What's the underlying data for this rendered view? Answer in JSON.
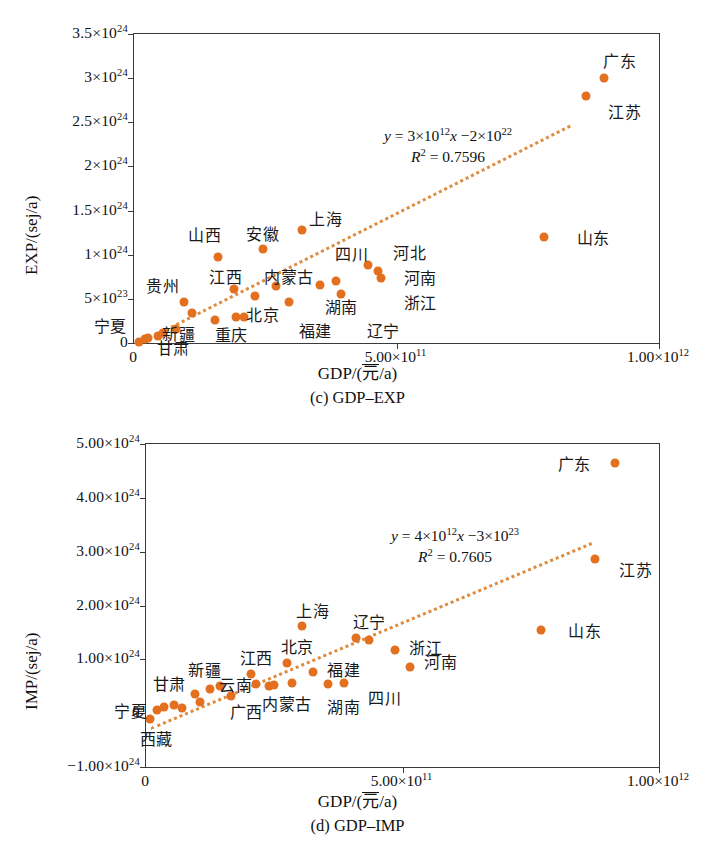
{
  "figure": {
    "point_color": "#e2701e",
    "trend_color": "#e08a3c",
    "axis_color": "#3a3a3a"
  },
  "chart_data": [
    {
      "type": "scatter",
      "id": "c",
      "caption": "(c) GDP–EXP",
      "title": "",
      "xlabel_prefix": "GDP/(",
      "xlabel_unit": "元",
      "xlabel_suffix": "/a)",
      "ylabel": "EXP/(sej/a)",
      "xlim": [
        0,
        1000000000000.0
      ],
      "ylim": [
        0,
        3.5e+24
      ],
      "grid": false,
      "xticks": [
        {
          "value": 0,
          "label": "0"
        },
        {
          "value": 500000000000.0,
          "label": "5.00×10",
          "exp": "11"
        },
        {
          "value": 1000000000000.0,
          "label": "1.00×10",
          "exp": "12"
        }
      ],
      "yticks": [
        {
          "value": 0,
          "label": "0",
          "exp": ""
        },
        {
          "value": 5e+23,
          "label": "5×10",
          "exp": "23"
        },
        {
          "value": 1e+24,
          "label": "1×10",
          "exp": "24"
        },
        {
          "value": 1.5e+24,
          "label": "1.5×10",
          "exp": "24"
        },
        {
          "value": 2e+24,
          "label": "2×10",
          "exp": "24"
        },
        {
          "value": 2.5e+24,
          "label": "2.5×10",
          "exp": "24"
        },
        {
          "value": 3e+24,
          "label": "3×10",
          "exp": "24"
        },
        {
          "value": 3.5e+24,
          "label": "3.5×10",
          "exp": "24"
        }
      ],
      "equation": "y = 3×10¹²x −2×10²²",
      "equation_parts": {
        "lead": "y",
        "eq": " = 3×10",
        "e1": "12",
        "xvar": "x",
        "tail": " −2×10",
        "e2": "22"
      },
      "r2_label": "R",
      "r2_sup": "2",
      "r2_value": " = 0.7596",
      "trendline": {
        "slope": 3000000000000.0,
        "intercept": -2e+22,
        "x_start": 40000000000.0,
        "x_end": 830000000000.0
      },
      "points": [
        {
          "name": "宁夏",
          "x": 10000000000.0,
          "y": 1e+22,
          "lx": -0.045,
          "ly": 2e+23
        },
        {
          "name": "西藏",
          "x": 20000000000.0,
          "y": 4e+22,
          "lx": null,
          "ly": null
        },
        {
          "name": "青海",
          "x": 26000000000.0,
          "y": 6e+22,
          "lx": null,
          "ly": null
        },
        {
          "name": "甘肃",
          "x": 45000000000.0,
          "y": 8e+22,
          "lx": 0.075,
          "ly": -4e+22
        },
        {
          "name": "海南",
          "x": 55000000000.0,
          "y": 1.1e+23,
          "lx": null,
          "ly": null
        },
        {
          "name": "新疆",
          "x": 80000000000.0,
          "y": 1.6e+23,
          "lx": 0.085,
          "ly": 1.1e+23
        },
        {
          "name": "贵州",
          "x": 95000000000.0,
          "y": 4.6e+23,
          "lx": 0.055,
          "ly": 6.6e+23
        },
        {
          "name": "吉林",
          "x": 110000000000.0,
          "y": 3.4e+23,
          "lx": null,
          "ly": null
        },
        {
          "name": "山西",
          "x": 160000000000.0,
          "y": 9.7e+23,
          "lx": 0.135,
          "ly": 1.23e+24
        },
        {
          "name": "重庆",
          "x": 155000000000.0,
          "y": 2.6e+23,
          "lx": 0.185,
          "ly": 1e+23
        },
        {
          "name": "江西",
          "x": 190000000000.0,
          "y": 6.1e+23,
          "lx": 0.175,
          "ly": 7.6e+23
        },
        {
          "name": "广西",
          "x": 195000000000.0,
          "y": 2.9e+23,
          "lx": null,
          "ly": null
        },
        {
          "name": "北京",
          "x": 210000000000.0,
          "y": 3e+23,
          "lx": 0.245,
          "ly": 3.3e+23
        },
        {
          "name": "安徽",
          "x": 245000000000.0,
          "y": 1.06e+24,
          "lx": 0.245,
          "ly": 1.25e+24
        },
        {
          "name": "云南",
          "x": 230000000000.0,
          "y": 5.3e+23,
          "lx": null,
          "ly": null
        },
        {
          "name": "内蒙古",
          "x": 270000000000.0,
          "y": 6.4e+23,
          "lx": 0.295,
          "ly": 7.6e+23
        },
        {
          "name": "福建",
          "x": 295000000000.0,
          "y": 4.6e+23,
          "lx": 0.345,
          "ly": 1.5e+23
        },
        {
          "name": "上海",
          "x": 320000000000.0,
          "y": 1.28e+24,
          "lx": 0.365,
          "ly": 1.42e+24
        },
        {
          "name": "湖南",
          "x": 355000000000.0,
          "y": 6.6e+23,
          "lx": 0.395,
          "ly": 4.2e+23
        },
        {
          "name": "四川",
          "x": 385000000000.0,
          "y": 7e+23,
          "lx": 0.415,
          "ly": 1.02e+24
        },
        {
          "name": "辽宁",
          "x": 395000000000.0,
          "y": 5.5e+23,
          "lx": 0.475,
          "ly": 1.5e+23
        },
        {
          "name": "河北",
          "x": 445000000000.0,
          "y": 8.8e+23,
          "lx": 0.525,
          "ly": 1.03e+24
        },
        {
          "name": "河南",
          "x": 465000000000.0,
          "y": 8.2e+23,
          "lx": 0.545,
          "ly": 7.5e+23
        },
        {
          "name": "浙江",
          "x": 470000000000.0,
          "y": 7.4e+23,
          "lx": 0.545,
          "ly": 4.6e+23
        },
        {
          "name": "山东",
          "x": 780000000000.0,
          "y": 1.2e+24,
          "lx": 0.875,
          "ly": 1.2e+24
        },
        {
          "name": "江苏",
          "x": 860000000000.0,
          "y": 2.8e+24,
          "lx": 0.935,
          "ly": 2.63e+24
        },
        {
          "name": "广东",
          "x": 895000000000.0,
          "y": 3e+24,
          "lx": 0.925,
          "ly": 3.2e+24
        }
      ]
    },
    {
      "type": "scatter",
      "id": "d",
      "caption": "(d) GDP–IMP",
      "title": "",
      "xlabel_prefix": "GDP/(",
      "xlabel_unit": "元",
      "xlabel_suffix": "/a)",
      "ylabel": "IMP/(sej/a)",
      "xlim": [
        0,
        1000000000000.0
      ],
      "ylim": [
        -1e+24,
        5e+24
      ],
      "grid": false,
      "xticks": [
        {
          "value": 0,
          "label": "0"
        },
        {
          "value": 500000000000.0,
          "label": "5.00×10",
          "exp": "11"
        },
        {
          "value": 1000000000000.0,
          "label": "1.00×10",
          "exp": "12"
        }
      ],
      "yticks": [
        {
          "value": -1e+24,
          "label": "−1.00×10",
          "exp": "24"
        },
        {
          "value": 0,
          "label": "0",
          "exp": ""
        },
        {
          "value": 1e+24,
          "label": "1.00×10",
          "exp": "24"
        },
        {
          "value": 2e+24,
          "label": "2.00×10",
          "exp": "24"
        },
        {
          "value": 3e+24,
          "label": "3.00×10",
          "exp": "24"
        },
        {
          "value": 4e+24,
          "label": "4.00×10",
          "exp": "24"
        },
        {
          "value": 5e+24,
          "label": "5.00×10",
          "exp": "24"
        }
      ],
      "equation": "y = 4×10¹²x −3×10²³",
      "equation_parts": {
        "lead": "y",
        "eq": " = 4×10",
        "e1": "12",
        "xvar": "x",
        "tail": " −3×10",
        "e2": "23"
      },
      "r2_label": "R",
      "r2_sup": "2",
      "r2_value": " = 0.7605",
      "trendline": {
        "slope": 4000000000000.0,
        "intercept": -3e+23,
        "x_start": 10000000000.0,
        "x_end": 870000000000.0
      },
      "points": [
        {
          "name": "西藏",
          "x": 8000000000.0,
          "y": -1e+23,
          "lx": 0.02,
          "ly": -4.6e+23
        },
        {
          "name": "宁夏",
          "x": 22000000000.0,
          "y": 5e+22,
          "lx": -0.03,
          "ly": 5e+22
        },
        {
          "name": "青海",
          "x": 35000000000.0,
          "y": 1.2e+23,
          "lx": null,
          "ly": null
        },
        {
          "name": "甘肃",
          "x": 55000000000.0,
          "y": 1.6e+23,
          "lx": 0.045,
          "ly": 5.6e+23
        },
        {
          "name": "海南",
          "x": 70000000000.0,
          "y": 1e+23,
          "lx": null,
          "ly": null
        },
        {
          "name": "新疆",
          "x": 95000000000.0,
          "y": 3.6e+23,
          "lx": 0.115,
          "ly": 8.2e+23
        },
        {
          "name": "贵州",
          "x": 105000000000.0,
          "y": 2e+23,
          "lx": null,
          "ly": null
        },
        {
          "name": "吉林",
          "x": 125000000000.0,
          "y": 4.4e+23,
          "lx": null,
          "ly": null
        },
        {
          "name": "云南",
          "x": 145000000000.0,
          "y": 5e+23,
          "lx": 0.175,
          "ly": 5.4e+23
        },
        {
          "name": "广西",
          "x": 165000000000.0,
          "y": 3.2e+23,
          "lx": 0.195,
          "ly": 4e+22
        },
        {
          "name": "江西",
          "x": 205000000000.0,
          "y": 7.2e+23,
          "lx": 0.215,
          "ly": 1.04e+24
        },
        {
          "name": "重庆",
          "x": 215000000000.0,
          "y": 5.4e+23,
          "lx": null,
          "ly": null
        },
        {
          "name": "内蒙古",
          "x": 240000000000.0,
          "y": 5e+23,
          "lx": 0.275,
          "ly": 1.8e+23
        },
        {
          "name": "山西",
          "x": 250000000000.0,
          "y": 5.2e+23,
          "lx": null,
          "ly": null
        },
        {
          "name": "北京",
          "x": 275000000000.0,
          "y": 9.3e+23,
          "lx": 0.295,
          "ly": 1.25e+24
        },
        {
          "name": "安徽",
          "x": 285000000000.0,
          "y": 5.6e+23,
          "lx": null,
          "ly": null
        },
        {
          "name": "上海",
          "x": 305000000000.0,
          "y": 1.62e+24,
          "lx": 0.325,
          "ly": 1.92e+24
        },
        {
          "name": "福建",
          "x": 325000000000.0,
          "y": 7.6e+23,
          "lx": 0.385,
          "ly": 8.2e+23
        },
        {
          "name": "湖南",
          "x": 355000000000.0,
          "y": 5.4e+23,
          "lx": 0.385,
          "ly": 1.4e+23
        },
        {
          "name": "四川",
          "x": 385000000000.0,
          "y": 5.6e+23,
          "lx": 0.465,
          "ly": 3e+23
        },
        {
          "name": "辽宁",
          "x": 410000000000.0,
          "y": 1.4e+24,
          "lx": 0.435,
          "ly": 1.72e+24
        },
        {
          "name": "河北",
          "x": 435000000000.0,
          "y": 1.35e+24,
          "lx": null,
          "ly": null
        },
        {
          "name": "浙江",
          "x": 485000000000.0,
          "y": 1.18e+24,
          "lx": 0.545,
          "ly": 1.22e+24
        },
        {
          "name": "河南",
          "x": 515000000000.0,
          "y": 8.5e+23,
          "lx": 0.575,
          "ly": 9.6e+23
        },
        {
          "name": "山东",
          "x": 770000000000.0,
          "y": 1.55e+24,
          "lx": 0.855,
          "ly": 1.55e+24
        },
        {
          "name": "江苏",
          "x": 875000000000.0,
          "y": 2.86e+24,
          "lx": 0.955,
          "ly": 2.68e+24
        },
        {
          "name": "广东",
          "x": 915000000000.0,
          "y": 4.65e+24,
          "lx": 0.835,
          "ly": 4.65e+24
        }
      ]
    }
  ]
}
